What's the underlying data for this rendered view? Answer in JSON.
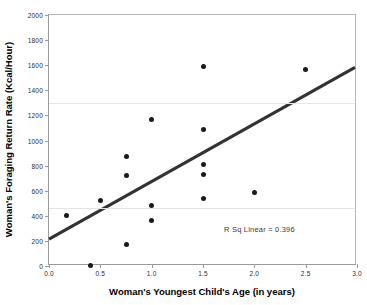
{
  "chart_data": {
    "type": "scatter",
    "title": "",
    "xlabel": "Woman's Youngest Child's Age (in years)",
    "ylabel": "Woman's Foraging Return Rate (Kcal/Hour)",
    "xlim": [
      0.0,
      3.0
    ],
    "ylim": [
      0,
      2000
    ],
    "xticks": [
      0.0,
      0.5,
      1.0,
      1.5,
      2.0,
      2.5,
      3.0
    ],
    "xtick_labels": [
      "0.0",
      "0.5",
      "1.0",
      "1.5",
      "2.0",
      "2.5",
      "3.0"
    ],
    "yticks": [
      0,
      200,
      400,
      600,
      800,
      1000,
      1200,
      1400,
      1600,
      1800,
      2000
    ],
    "ytick_labels": [
      "0",
      "200",
      "400",
      "600",
      "800",
      "1000",
      "1200",
      "1400",
      "1600",
      "1800",
      "2000"
    ],
    "grid": false,
    "legend": false,
    "marker_color": "#1a1a1a",
    "line_color": "#333333",
    "points": [
      {
        "x": 0.17,
        "y": 400
      },
      {
        "x": 0.4,
        "y": 5
      },
      {
        "x": 0.5,
        "y": 525
      },
      {
        "x": 0.75,
        "y": 875
      },
      {
        "x": 0.75,
        "y": 720
      },
      {
        "x": 0.75,
        "y": 170
      },
      {
        "x": 1.0,
        "y": 1170
      },
      {
        "x": 1.0,
        "y": 480
      },
      {
        "x": 1.0,
        "y": 360
      },
      {
        "x": 1.5,
        "y": 1590
      },
      {
        "x": 1.5,
        "y": 1085
      },
      {
        "x": 1.5,
        "y": 805
      },
      {
        "x": 1.5,
        "y": 730
      },
      {
        "x": 1.5,
        "y": 535
      },
      {
        "x": 2.0,
        "y": 585
      },
      {
        "x": 2.5,
        "y": 1565
      }
    ],
    "fit_line": {
      "label": "linear fit",
      "x_start": 0.0,
      "y_start": 200,
      "x_end": 3.0,
      "y_end": 1580
    },
    "annotations": [
      {
        "name": "r-squared",
        "text": "R Sq Linear = 0.396",
        "x": 2.05,
        "y": 295
      }
    ]
  }
}
